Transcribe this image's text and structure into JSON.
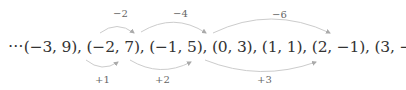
{
  "sequence_text": "⋯(−3, 9), (−2, 7), (−1, 5), (0, 3), (1, 1), (2, −1), (3, −3), (4, −5)⋯이지?",
  "top_arcs": [
    {
      "label": "−2"
    },
    {
      "label": "−4"
    },
    {
      "label": "−6"
    }
  ],
  "bottom_arcs": [
    {
      "label": "+1"
    },
    {
      "label": "+2"
    },
    {
      "label": "+3"
    }
  ],
  "colors": {
    "arc": "#c8c8c8",
    "text": "#333333"
  }
}
